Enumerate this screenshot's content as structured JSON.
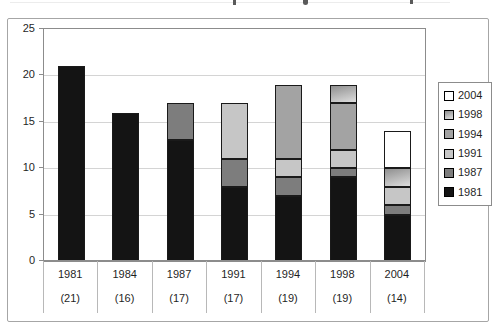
{
  "y_axis": {
    "tick_labels": [
      "0",
      "5",
      "10",
      "15",
      "20",
      "25"
    ]
  },
  "x_axis": {
    "year_labels": [
      "1981",
      "1984",
      "1987",
      "1991",
      "1994",
      "1998",
      "2004"
    ],
    "count_labels": [
      "(21)",
      "(16)",
      "(17)",
      "(17)",
      "(19)",
      "(19)",
      "(14)"
    ]
  },
  "legend": {
    "order": [
      "2004",
      "1998",
      "1994",
      "1991",
      "1987",
      "1981"
    ]
  },
  "colors": {
    "segment_border": "#1a1a1a",
    "grid": "#d4d4d4",
    "plot_border": "#8c8c8c",
    "frame_border": "#a6a6a6",
    "separator": "#b8b8b8"
  },
  "chart_data": {
    "type": "bar",
    "stacked": true,
    "categories": [
      "1981",
      "1984",
      "1987",
      "1991",
      "1994",
      "1998",
      "2004"
    ],
    "category_totals": [
      21,
      16,
      17,
      17,
      19,
      19,
      14
    ],
    "series": [
      {
        "name": "1981",
        "color": "#141414",
        "values": [
          21,
          16,
          13,
          8,
          7,
          9,
          5
        ]
      },
      {
        "name": "1987",
        "color": "#7d7d7d",
        "values": [
          0,
          0,
          4,
          3,
          2,
          1,
          1
        ]
      },
      {
        "name": "1991",
        "color": "#c6c6c6",
        "values": [
          0,
          0,
          0,
          6,
          2,
          2,
          2
        ]
      },
      {
        "name": "1994",
        "color": "#a3a3a3",
        "values": [
          0,
          0,
          0,
          0,
          8,
          5,
          0
        ]
      },
      {
        "name": "1998",
        "color": "#8f8f8f",
        "color2": "#dedede",
        "values": [
          0,
          0,
          0,
          0,
          0,
          2,
          2
        ]
      },
      {
        "name": "2004",
        "color": "#ffffff",
        "values": [
          0,
          0,
          0,
          0,
          0,
          0,
          4
        ]
      }
    ],
    "ylim": [
      0,
      25
    ],
    "yticks": [
      0,
      5,
      10,
      15,
      20,
      25
    ],
    "grid": true,
    "legend_position": "right",
    "xlabel": "",
    "ylabel": "",
    "title": ""
  }
}
